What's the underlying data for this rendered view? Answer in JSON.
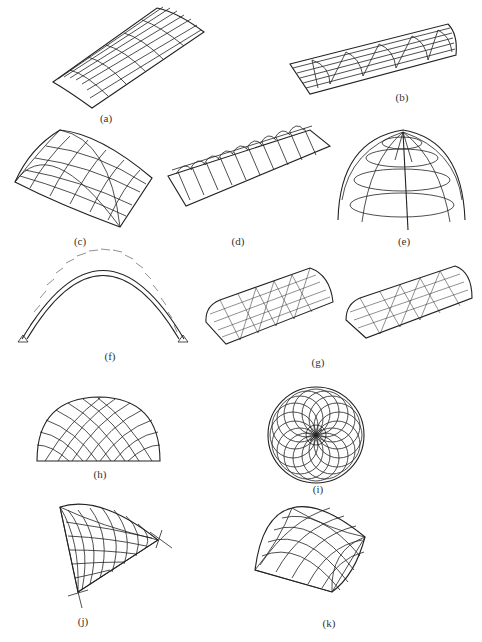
{
  "figure": {
    "panels": [
      {
        "id": "a",
        "label": "(a)",
        "description": "cylindrical barrel vault grid shell"
      },
      {
        "id": "b",
        "label": "(b)",
        "description": "barrel vault with transverse arch ribs"
      },
      {
        "id": "c",
        "label": "(c)",
        "description": "cross vault grid shell"
      },
      {
        "id": "d",
        "label": "(d)",
        "description": "long barrel vault with repeated transverse arches"
      },
      {
        "id": "e",
        "label": "(e)",
        "description": "ribbed spherical dome"
      },
      {
        "id": "f",
        "label": "(f)",
        "description": "lattice arch with pinned supports"
      },
      {
        "id": "g",
        "label": "(g)",
        "description": "two triangulated lattice barrel vaults"
      },
      {
        "id": "h",
        "label": "(h)",
        "description": "lamella dome elevation"
      },
      {
        "id": "i",
        "label": "(i)",
        "description": "lamella dome plan with rotated circles"
      },
      {
        "id": "j",
        "label": "(j)",
        "description": "single-corner supported grid shell"
      },
      {
        "id": "k",
        "label": "(k)",
        "description": "four-corner supported grid shell"
      }
    ]
  }
}
